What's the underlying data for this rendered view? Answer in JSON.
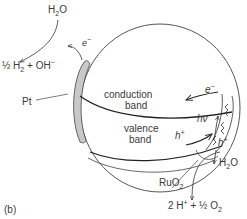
{
  "figure": {
    "panel_label": "(b)",
    "labels": {
      "h2o_top": "H2O",
      "h2_product": "½ H2 + OH−",
      "electron_top": "e−",
      "pt": "Pt",
      "conduction_band": [
        "conduction",
        "band"
      ],
      "valence_band": [
        "valence",
        "band"
      ],
      "electron_right": "e−",
      "photon": "hν",
      "hole_left": "h+",
      "hole_right": "h+",
      "h2o_bottom": "H2O",
      "ruo2": "RuO2",
      "o2_product": "2 H+ + ½ O2"
    },
    "colors": {
      "line": "#333333",
      "pt_fill": "#c8c8c8",
      "text": "#3a3a3a"
    }
  }
}
